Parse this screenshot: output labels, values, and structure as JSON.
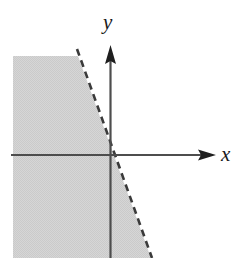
{
  "figure": {
    "name": "inequality-region-graph",
    "width": 239,
    "height": 258,
    "background_color": "#ffffff"
  },
  "axes": {
    "x_axis": {
      "label": "x",
      "color": "#4d4d4d",
      "arrow": "right-arrow",
      "y_pixel": 155,
      "x_start_pixel": 11,
      "x_end_pixel": 216
    },
    "y_axis": {
      "label": "y",
      "color": "#4d4d4d",
      "arrow": "up-arrow",
      "x_pixel": 110,
      "y_top_pixel": 46,
      "y_bottom_pixel": 258
    },
    "origin": {
      "x_pixel": 110,
      "y_pixel": 155
    }
  },
  "boundary_line": {
    "style": "dashed",
    "color": "#3a3a3a",
    "stroke_width": 2.6,
    "dash_pattern": "7 5",
    "passes_through_origin": true,
    "slope_sign": "negative-steep",
    "top_point": {
      "x": 78,
      "y": 50
    },
    "bottom_point": {
      "x": 151,
      "y": 258
    }
  },
  "shaded_region": {
    "name": "solution-region",
    "fill_color": "#d4d4d4",
    "description": "Region to the left of the dashed boundary line",
    "left_edge_x": 13,
    "top_edge_y": 56,
    "bottom_edge_y": 258
  }
}
